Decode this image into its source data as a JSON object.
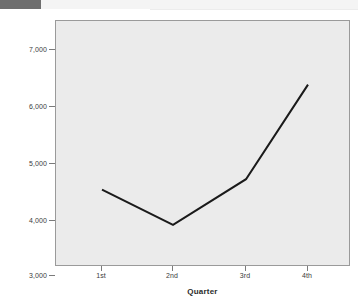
{
  "window": {
    "top_bar_color": "#6e6e6e",
    "background_color": "#ffffff"
  },
  "chart_data": {
    "type": "line",
    "title": "",
    "subtitle": "",
    "xlabel": "Quarter",
    "ylabel": "Sales in Units",
    "categories": [
      "1st",
      "2nd",
      "3rd",
      "4th"
    ],
    "values": [
      4350,
      3680,
      4550,
      6350
    ],
    "series": [
      {
        "name": "Sales in Units",
        "values": [
          4350,
          3680,
          4550,
          6350
        ],
        "color": "#1a1a1a",
        "line_width": 2
      }
    ],
    "ylim": [
      2880,
      7560
    ],
    "yticks": [
      3000,
      4000,
      5000,
      6000,
      7000
    ],
    "ytick_labels": [
      "3,000",
      "4,000",
      "5,000",
      "6,000",
      "7,000"
    ],
    "xticks": [
      "1st",
      "2nd",
      "3rd",
      "4th"
    ],
    "grid": false,
    "legend": null,
    "plot_background": "#ebebeb",
    "frame_color": "#9a9a9a",
    "annotations": []
  },
  "axes": {
    "y": {
      "title": "Sales in Units",
      "ticks": [
        {
          "label": "7,000",
          "value": 7000
        },
        {
          "label": "6,000",
          "value": 6000
        },
        {
          "label": "5,000",
          "value": 5000
        },
        {
          "label": "4,000",
          "value": 4000
        },
        {
          "label": "3,000",
          "value": 3000
        }
      ]
    },
    "x": {
      "title": "Quarter",
      "ticks": [
        {
          "label": "1st"
        },
        {
          "label": "2nd"
        },
        {
          "label": "3rd"
        },
        {
          "label": "4th"
        }
      ]
    }
  }
}
